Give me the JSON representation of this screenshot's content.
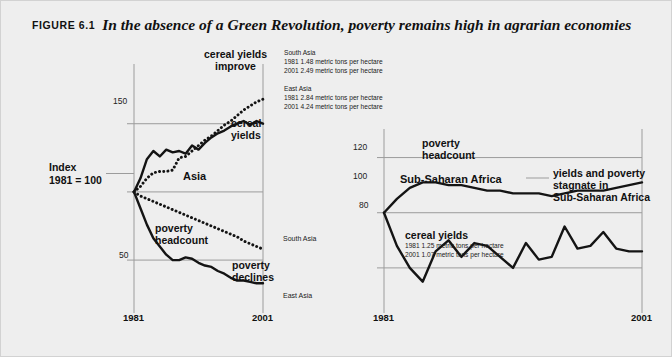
{
  "figure": {
    "label": "FIGURE 6.1",
    "headline": "In the absence of a Green Revolution, poverty remains high in agrarian economies",
    "background_color": "#eeeeee",
    "line_color": "#141414"
  },
  "left_panel": {
    "annotations": {
      "cereal_improve": "cereal yields\nimprove",
      "cereal_yields": "cereal\nyields",
      "poverty_headcount": "poverty\nheadcount",
      "poverty_declines": "poverty\ndeclines",
      "asia": "Asia",
      "index": "Index\n1981 = 100"
    },
    "notes": [
      {
        "region": "South Asia",
        "lines": [
          "1981  1.48 metric tons per hectare",
          "2001  2.49 metric tons per hectare"
        ]
      },
      {
        "region": "East Asia",
        "lines": [
          "1981  2.84 metric tons per hectare",
          "2001  4.24 metric tons per hectare"
        ]
      }
    ],
    "end_labels": {
      "south_asia": "South Asia",
      "east_asia": "East Asia"
    }
  },
  "right_panel": {
    "annotations": {
      "poverty_headcount": "poverty\nheadcount",
      "region": "Sub-Saharan Africa",
      "callout": "yields and poverty\nstagnate in\nSub-Saharan Africa",
      "cereal_yields": "cereal yields"
    },
    "notes": {
      "lines": [
        "1981  1.25 metric tons per hectare",
        "2001  1.07 metric tons per hectare"
      ]
    }
  },
  "chart_data": [
    {
      "id": "left-chart",
      "type": "line",
      "title": "Asia: cereal yields and poverty headcount, index 1981 = 100",
      "xlabel": "",
      "ylabel": "Index 1981 = 100",
      "x": [
        1981,
        1982,
        1983,
        1984,
        1985,
        1986,
        1987,
        1988,
        1989,
        1990,
        1991,
        1992,
        1993,
        1994,
        1995,
        1996,
        1997,
        1998,
        1999,
        2000,
        2001
      ],
      "xlim": [
        1981,
        2001
      ],
      "ylim": [
        20,
        185
      ],
      "yticks": [
        50,
        100,
        150
      ],
      "xticks": [
        1981,
        2001
      ],
      "grid": true,
      "legend": "none",
      "series": [
        {
          "name": "East Asia cereal yields",
          "style": "solid",
          "label": "cereal yields",
          "end_label": "",
          "values": [
            100,
            110,
            124,
            130,
            126,
            131,
            129,
            130,
            128,
            134,
            131,
            136,
            140,
            143,
            145,
            148,
            150,
            152,
            149,
            152,
            150
          ]
        },
        {
          "name": "South Asia cereal yields",
          "style": "dotted",
          "label": "cereal yields improve",
          "end_label": "",
          "values": [
            100,
            104,
            110,
            114,
            115,
            115,
            116,
            125,
            126,
            130,
            134,
            138,
            141,
            145,
            149,
            152,
            156,
            160,
            163,
            166,
            168
          ]
        },
        {
          "name": "East Asia poverty headcount",
          "style": "solid",
          "label": "poverty headcount",
          "end_label": "East Asia",
          "values": [
            100,
            88,
            76,
            66,
            60,
            54,
            50,
            50,
            52,
            51,
            48,
            46,
            45,
            42,
            40,
            37,
            35,
            35,
            34,
            33,
            33
          ]
        },
        {
          "name": "South Asia poverty headcount",
          "style": "dotted",
          "label": "poverty declines",
          "end_label": "South Asia",
          "values": [
            100,
            97,
            95,
            93,
            91,
            89,
            87,
            85,
            83,
            81,
            79,
            77,
            75,
            73,
            71,
            69,
            67,
            64,
            62,
            60,
            58
          ]
        }
      ]
    },
    {
      "id": "right-chart",
      "type": "line",
      "title": "Sub-Saharan Africa: cereal yields and poverty headcount, index 1981 = 100",
      "xlabel": "",
      "ylabel": "Index 1981 = 100",
      "x": [
        1981,
        1982,
        1983,
        1984,
        1985,
        1986,
        1987,
        1988,
        1989,
        1990,
        1991,
        1992,
        1993,
        1994,
        1995,
        1996,
        1997,
        1998,
        1999,
        2000,
        2001
      ],
      "xlim": [
        1981,
        2001
      ],
      "ylim": [
        68,
        126
      ],
      "yticks": [
        80,
        100,
        120
      ],
      "xticks": [
        1981,
        2001
      ],
      "grid": true,
      "legend": "none",
      "series": [
        {
          "name": "poverty headcount",
          "style": "solid",
          "label": "poverty headcount",
          "values": [
            100,
            105,
            109,
            111,
            111,
            110,
            110,
            109,
            108,
            108,
            107,
            107,
            107,
            106,
            107,
            108,
            108,
            108,
            109,
            110,
            111
          ]
        },
        {
          "name": "cereal yields",
          "style": "solid",
          "label": "cereal yields",
          "values": [
            100,
            88,
            80,
            75,
            86,
            90,
            84,
            89,
            88,
            84,
            80,
            89,
            83,
            84,
            95,
            87,
            88,
            93,
            87,
            86,
            86
          ]
        }
      ]
    }
  ]
}
